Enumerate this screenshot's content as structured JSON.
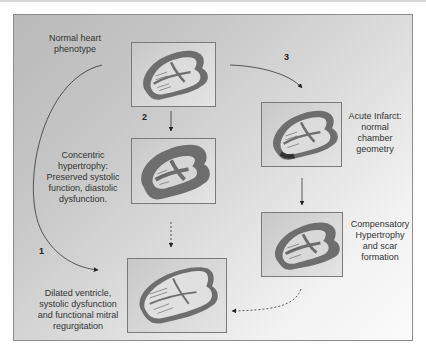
{
  "diagram": {
    "nodes": [
      {
        "id": "normal",
        "label_lines": [
          "Normal heart",
          "phenotype"
        ]
      },
      {
        "id": "concentric",
        "label_lines": [
          "Concentric",
          "hypertrophy:",
          "Preserved systolic",
          "function, diastolic",
          "dysfunction."
        ]
      },
      {
        "id": "dilated",
        "label_lines": [
          "Dilated ventricle,",
          "systolic dysfunction",
          "and functional mitral",
          "regurgitation"
        ]
      },
      {
        "id": "acute",
        "label_lines": [
          "Acute Infarct:",
          "normal",
          "chamber",
          "geometry"
        ]
      },
      {
        "id": "compensatory",
        "label_lines": [
          "Compensatory",
          "Hypertrophy",
          "and scar",
          "formation"
        ]
      }
    ],
    "paths": [
      {
        "number": "1",
        "from": "normal",
        "to": "dilated",
        "style": "solid curved"
      },
      {
        "number": "2",
        "from": "normal",
        "to": "concentric",
        "style": "solid"
      },
      {
        "number": "3",
        "from": "normal",
        "to": "acute",
        "style": "solid curved"
      }
    ],
    "secondary_edges": [
      {
        "from": "concentric",
        "to": "dilated",
        "style": "dashed"
      },
      {
        "from": "acute",
        "to": "compensatory",
        "style": "solid"
      },
      {
        "from": "compensatory",
        "to": "dilated",
        "style": "dashed curved"
      }
    ],
    "colors": {
      "myocardium": "#6e6e6e",
      "infarct_scar": "#3a3a3a",
      "arrow": "#222222"
    }
  }
}
